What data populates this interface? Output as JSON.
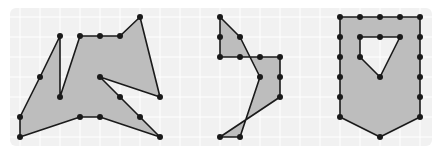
{
  "diagram": {
    "background": "#ffffff",
    "panel": {
      "x": 10,
      "y": 8,
      "w": 422,
      "h": 138,
      "fill": "#f1f1f1",
      "radius": 6
    },
    "grid": {
      "spacing": 20,
      "origin_x": 0,
      "origin_y": -3,
      "color": "#ffffff"
    },
    "shape_fill": "#bdbdbd",
    "stroke": "#1a1a1a",
    "dot_radius": 3,
    "figures": [
      {
        "name": "figure-1-irregular-polygon",
        "outline": [
          [
            140,
            17
          ],
          [
            160,
            97
          ],
          [
            100,
            77
          ],
          [
            120,
            97
          ],
          [
            140,
            117
          ],
          [
            160,
            137
          ],
          [
            100,
            117
          ],
          [
            80,
            117
          ],
          [
            20,
            137
          ],
          [
            20,
            117
          ],
          [
            40,
            77
          ],
          [
            60,
            36
          ],
          [
            60,
            97
          ],
          [
            80,
            36
          ],
          [
            100,
            36
          ],
          [
            120,
            36
          ]
        ],
        "dots": [
          [
            140,
            17
          ],
          [
            160,
            97
          ],
          [
            100,
            77
          ],
          [
            120,
            97
          ],
          [
            140,
            117
          ],
          [
            160,
            137
          ],
          [
            100,
            117
          ],
          [
            80,
            117
          ],
          [
            20,
            137
          ],
          [
            20,
            117
          ],
          [
            40,
            77
          ],
          [
            60,
            36
          ],
          [
            60,
            97
          ],
          [
            80,
            36
          ],
          [
            100,
            36
          ],
          [
            120,
            36
          ]
        ]
      },
      {
        "name": "figure-2-self-intersecting-polygon",
        "outline": [
          [
            220,
            17
          ],
          [
            240,
            37
          ],
          [
            260,
            77
          ],
          [
            240,
            137
          ],
          [
            220,
            137
          ],
          [
            280,
            97
          ],
          [
            280,
            57
          ],
          [
            220,
            57
          ]
        ],
        "dots": [
          [
            220,
            17
          ],
          [
            220,
            37
          ],
          [
            240,
            37
          ],
          [
            220,
            57
          ],
          [
            240,
            57
          ],
          [
            260,
            57
          ],
          [
            280,
            57
          ],
          [
            260,
            77
          ],
          [
            280,
            77
          ],
          [
            280,
            97
          ],
          [
            220,
            137
          ],
          [
            240,
            137
          ]
        ]
      },
      {
        "name": "figure-3-shield-with-hole",
        "outline": [
          [
            340,
            17
          ],
          [
            420,
            17
          ],
          [
            420,
            117
          ],
          [
            380,
            137
          ],
          [
            340,
            117
          ]
        ],
        "hole": [
          [
            360,
            37
          ],
          [
            400,
            37
          ],
          [
            380,
            77
          ],
          [
            360,
            57
          ]
        ],
        "dots": [
          [
            340,
            17
          ],
          [
            360,
            17
          ],
          [
            380,
            17
          ],
          [
            400,
            17
          ],
          [
            420,
            17
          ],
          [
            340,
            37
          ],
          [
            420,
            37
          ],
          [
            340,
            57
          ],
          [
            420,
            57
          ],
          [
            340,
            77
          ],
          [
            420,
            77
          ],
          [
            340,
            97
          ],
          [
            420,
            97
          ],
          [
            340,
            117
          ],
          [
            420,
            117
          ],
          [
            380,
            137
          ],
          [
            360,
            37
          ],
          [
            380,
            37
          ],
          [
            400,
            37
          ],
          [
            360,
            57
          ],
          [
            380,
            77
          ]
        ]
      }
    ]
  }
}
